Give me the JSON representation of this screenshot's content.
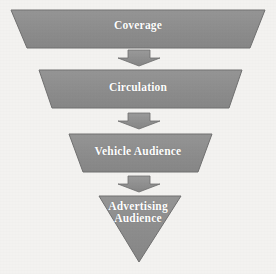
{
  "diagram": {
    "type": "inverted-funnel",
    "title": "",
    "background_color": "#f3f2f0",
    "shape_fill_color": "#8d8d8d",
    "shape_stroke_color": "#6f6f6f",
    "label_color": "#ffffff",
    "arrow_fill_color": "#8d8d8d",
    "arrow_stroke_color": "#6b6b6b",
    "stages": [
      {
        "id": "coverage",
        "label": "Coverage",
        "shape": "trapezoid",
        "level": 1
      },
      {
        "id": "circulation",
        "label": "Circulation",
        "shape": "trapezoid",
        "level": 2
      },
      {
        "id": "vehicle-audience",
        "label": "Vehicle Audience",
        "shape": "trapezoid",
        "level": 3
      },
      {
        "id": "advertising-audience",
        "label": "Advertising\nAudience",
        "shape": "triangle",
        "level": 4
      }
    ],
    "connectors": [
      {
        "id": "arrow-1",
        "from": "coverage",
        "to": "circulation",
        "direction": "down"
      },
      {
        "id": "arrow-2",
        "from": "circulation",
        "to": "vehicle-audience",
        "direction": "down"
      },
      {
        "id": "arrow-3",
        "from": "vehicle-audience",
        "to": "advertising-audience",
        "direction": "down"
      }
    ]
  }
}
